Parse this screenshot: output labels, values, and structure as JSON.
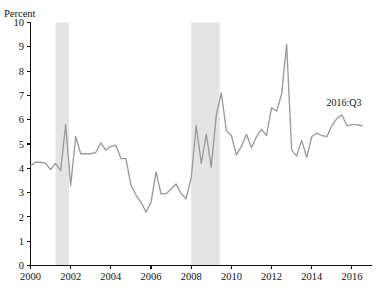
{
  "chart_data": {
    "type": "line",
    "title": "",
    "xlabel": "",
    "ylabel": "Percent",
    "ylim": [
      0,
      10
    ],
    "xlim": [
      2000.0,
      2017.0
    ],
    "ytick_step": 1,
    "grid": false,
    "legend": "none",
    "line_color": "#9a9a9a",
    "recession_band_color": "#e4e4e4",
    "ytick_labels": [
      "0",
      "1",
      "2",
      "3",
      "4",
      "5",
      "6",
      "7",
      "8",
      "9",
      "10"
    ],
    "ytick_values": [
      0,
      1,
      2,
      3,
      4,
      5,
      6,
      7,
      8,
      9,
      10
    ],
    "xtick_labels": [
      "2000",
      "2002",
      "2004",
      "2006",
      "2008",
      "2010",
      "2012",
      "2014",
      "2016"
    ],
    "xtick_values": [
      2000,
      2002,
      2004,
      2006,
      2008,
      2010,
      2012,
      2014,
      2016
    ],
    "annotations": [
      {
        "text": "2016:Q3",
        "x": 2015.6,
        "y": 6.55
      }
    ],
    "shaded_regions": [
      {
        "name": "recession-2001",
        "x0": 2001.25,
        "x1": 2001.92
      },
      {
        "name": "recession-2008",
        "x0": 2008.0,
        "x1": 2009.42
      }
    ],
    "x": [
      2000.0,
      2000.25,
      2000.5,
      2000.75,
      2001.0,
      2001.25,
      2001.5,
      2001.75,
      2002.0,
      2002.25,
      2002.5,
      2002.75,
      2003.0,
      2003.25,
      2003.5,
      2003.75,
      2004.0,
      2004.25,
      2004.5,
      2004.75,
      2005.0,
      2005.25,
      2005.5,
      2005.75,
      2006.0,
      2006.25,
      2006.5,
      2006.75,
      2007.0,
      2007.25,
      2007.5,
      2007.75,
      2008.0,
      2008.25,
      2008.5,
      2008.75,
      2009.0,
      2009.25,
      2009.5,
      2009.75,
      2010.0,
      2010.25,
      2010.5,
      2010.75,
      2011.0,
      2011.25,
      2011.5,
      2011.75,
      2012.0,
      2012.25,
      2012.5,
      2012.75,
      2013.0,
      2013.25,
      2013.5,
      2013.75,
      2014.0,
      2014.25,
      2014.5,
      2014.75,
      2015.0,
      2015.25,
      2015.5,
      2015.75,
      2016.0,
      2016.25,
      2016.5
    ],
    "values": [
      4.1,
      4.25,
      4.25,
      4.2,
      3.95,
      4.2,
      3.9,
      5.8,
      3.3,
      5.3,
      4.6,
      4.6,
      4.6,
      4.65,
      5.05,
      4.75,
      4.9,
      4.95,
      4.4,
      4.4,
      3.3,
      2.9,
      2.6,
      2.2,
      2.6,
      3.85,
      2.95,
      2.95,
      3.15,
      3.35,
      2.95,
      2.75,
      3.6,
      5.75,
      4.2,
      5.4,
      4.05,
      6.2,
      7.1,
      5.55,
      5.35,
      4.55,
      4.9,
      5.4,
      4.85,
      5.3,
      5.6,
      5.35,
      6.5,
      6.35,
      7.05,
      9.1,
      4.75,
      4.5,
      5.15,
      4.45,
      5.3,
      5.45,
      5.35,
      5.3,
      5.75,
      6.05,
      6.2,
      5.75,
      5.8,
      5.8,
      5.75
    ],
    "series": [
      {
        "name": "percent-series",
        "values": [
          4.1,
          4.25,
          4.25,
          4.2,
          3.95,
          4.2,
          3.9,
          5.8,
          3.3,
          5.3,
          4.6,
          4.6,
          4.6,
          4.65,
          5.05,
          4.75,
          4.9,
          4.95,
          4.4,
          4.4,
          3.3,
          2.9,
          2.6,
          2.2,
          2.6,
          3.85,
          2.95,
          2.95,
          3.15,
          3.35,
          2.95,
          2.75,
          3.6,
          5.75,
          4.2,
          5.4,
          4.05,
          6.2,
          7.1,
          5.55,
          5.35,
          4.55,
          4.9,
          5.4,
          4.85,
          5.3,
          5.6,
          5.35,
          6.5,
          6.35,
          7.05,
          9.1,
          4.75,
          4.5,
          5.15,
          4.45,
          5.3,
          5.45,
          5.35,
          5.3,
          5.75,
          6.05,
          6.2,
          5.75,
          5.8,
          5.8,
          5.75
        ]
      }
    ]
  }
}
